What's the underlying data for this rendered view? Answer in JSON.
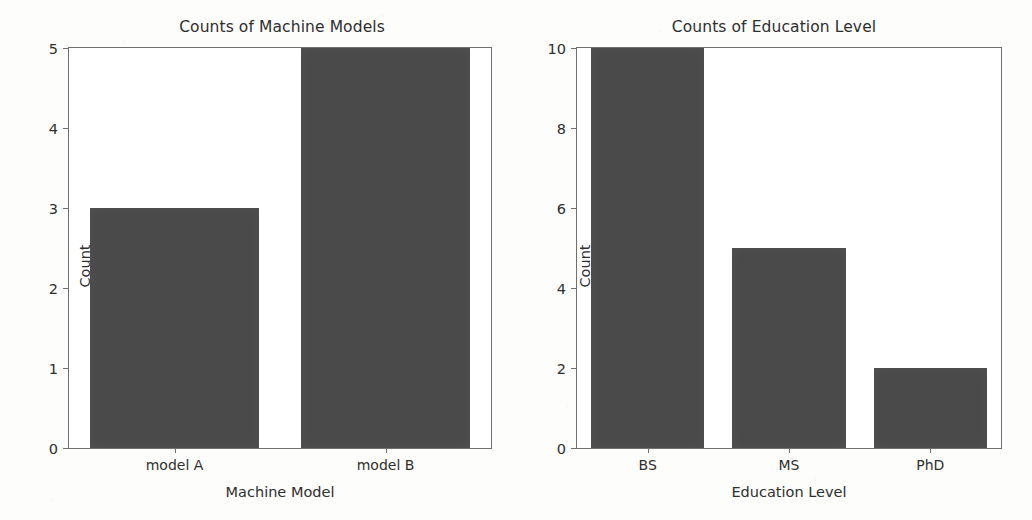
{
  "chart_data": [
    {
      "type": "bar",
      "title": "Counts of Machine Models",
      "xlabel": "Machine Model",
      "ylabel": "Count",
      "categories": [
        "model A",
        "model B"
      ],
      "values": [
        3,
        5
      ],
      "ylim": [
        0,
        5
      ],
      "yticks": [
        0,
        1,
        2,
        3,
        4,
        5
      ],
      "ytick_labels": [
        "0",
        "1",
        "2",
        "3",
        "4",
        "5"
      ],
      "grid": false,
      "legend": false,
      "bar_color": "#4a4a4a"
    },
    {
      "type": "bar",
      "title": "Counts of Education Level",
      "xlabel": "Education Level",
      "ylabel": "Count",
      "categories": [
        "BS",
        "MS",
        "PhD"
      ],
      "values": [
        10,
        5,
        2
      ],
      "ylim": [
        0,
        10
      ],
      "yticks": [
        0,
        2,
        4,
        6,
        8,
        10
      ],
      "ytick_labels": [
        "0",
        "2",
        "4",
        "6",
        "8",
        "10"
      ],
      "grid": false,
      "legend": false,
      "bar_color": "#4a4a4a"
    }
  ]
}
